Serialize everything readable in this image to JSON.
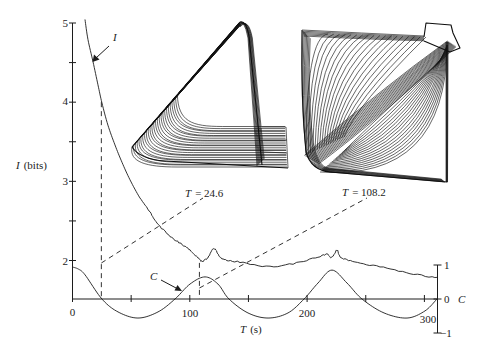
{
  "figure": {
    "y_axis": {
      "label_var": "I",
      "label_unit": "(bits)",
      "tick_labels": [
        "5",
        "4",
        "3",
        "2"
      ]
    },
    "x_axis": {
      "label_var": "T",
      "label_unit": "(s)",
      "tick_labels": [
        "0",
        "100",
        "200",
        "300"
      ]
    },
    "right_axis": {
      "label_var": "C",
      "tick_labels": [
        "1",
        "0",
        "−1"
      ]
    },
    "curve_labels": {
      "info": "I",
      "control": "C"
    },
    "insets": [
      {
        "label_var": "T",
        "label_rest": "= 24.6"
      },
      {
        "label_var": "T",
        "label_rest": "= 108.2"
      }
    ]
  },
  "chart_data": {
    "type": "line",
    "title": "",
    "xlabel": "T (s)",
    "ylabel": "I (bits)",
    "y2label": "C",
    "xlim": [
      0,
      312
    ],
    "ylim": [
      1.5,
      5
    ],
    "y2lim": [
      -1,
      1
    ],
    "x_ticks": [
      0,
      50,
      100,
      150,
      200,
      250,
      300
    ],
    "x_tick_labels": [
      "0",
      "100",
      "200",
      "300"
    ],
    "y_ticks": [
      2,
      2.5,
      3,
      3.5,
      4,
      4.5,
      5
    ],
    "y_tick_labels": [
      "2",
      "3",
      "4",
      "5"
    ],
    "y2_ticks": [
      -1,
      0,
      1
    ],
    "grid": false,
    "legend": "none",
    "series": [
      {
        "name": "I",
        "axis": "left",
        "points": [
          [
            10.7,
            5.04
          ],
          [
            13.2,
            4.79
          ],
          [
            17.5,
            4.51
          ],
          [
            21.7,
            4.22
          ],
          [
            25.1,
            3.99
          ],
          [
            30.2,
            3.71
          ],
          [
            36.2,
            3.46
          ],
          [
            42.2,
            3.24
          ],
          [
            49.0,
            3.02
          ],
          [
            57.5,
            2.79
          ],
          [
            66.1,
            2.61
          ],
          [
            72.0,
            2.47
          ],
          [
            83.1,
            2.31
          ],
          [
            91.6,
            2.22
          ],
          [
            100.2,
            2.13
          ],
          [
            107.0,
            2.03
          ],
          [
            110.4,
            1.99
          ],
          [
            115.5,
            2.04
          ],
          [
            120.6,
            2.15
          ],
          [
            124.9,
            2.06
          ],
          [
            129.2,
            2.01
          ],
          [
            142.8,
            1.98
          ],
          [
            168.4,
            1.92
          ],
          [
            194.0,
            1.98
          ],
          [
            212.7,
            2.06
          ],
          [
            217.0,
            2.08
          ],
          [
            221.2,
            2.04
          ],
          [
            225.5,
            2.13
          ],
          [
            228.9,
            2.04
          ],
          [
            240.8,
            1.98
          ],
          [
            262.1,
            1.92
          ],
          [
            287.7,
            1.84
          ],
          [
            310.7,
            1.78
          ]
        ]
      },
      {
        "name": "C",
        "axis": "right",
        "points": [
          [
            0,
            0.94
          ],
          [
            5,
            0.88
          ],
          [
            10.7,
            0.71
          ],
          [
            25.1,
            0
          ],
          [
            38.8,
            -0.38
          ],
          [
            55.8,
            -0.56
          ],
          [
            72.9,
            -0.38
          ],
          [
            87.4,
            0
          ],
          [
            100.2,
            0.44
          ],
          [
            113.0,
            0.65
          ],
          [
            124.0,
            0.44
          ],
          [
            133.4,
            0
          ],
          [
            149.6,
            -0.41
          ],
          [
            166.7,
            -0.56
          ],
          [
            183.7,
            -0.41
          ],
          [
            197.4,
            0
          ],
          [
            209.3,
            0.47
          ],
          [
            221.2,
            0.85
          ],
          [
            234.0,
            0.47
          ],
          [
            246.8,
            0
          ],
          [
            265.6,
            -0.41
          ],
          [
            285.2,
            -0.56
          ],
          [
            300.5,
            -0.35
          ],
          [
            310.7,
            0
          ]
        ]
      }
    ],
    "annotations": [
      {
        "text": "T = 24.6",
        "T": 24.6,
        "I": 4.0,
        "type": "dashed-marker",
        "inset": "triangular attractor"
      },
      {
        "text": "T = 108.2",
        "T": 108.2,
        "I": 1.97,
        "type": "dashed-marker",
        "inset": "square attractor"
      },
      {
        "text": "I",
        "type": "arrow-label",
        "target_series": "I"
      },
      {
        "text": "C",
        "type": "arrow-label",
        "target_series": "C"
      }
    ]
  }
}
